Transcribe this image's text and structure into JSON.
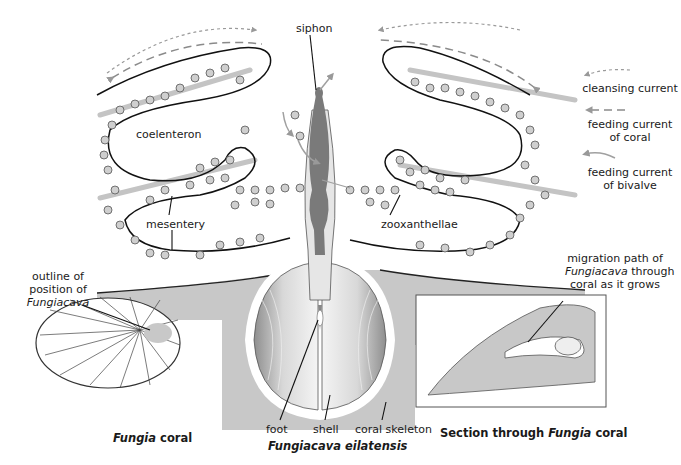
{
  "labels": {
    "siphon": "siphon",
    "coelenteron": "coelenteron",
    "mesentery": "mesentery",
    "zooxanthellae": "zooxanthellae",
    "foot": "foot",
    "shell": "shell",
    "coral_skeleton": "coral skeleton",
    "outline_line1": "outline of",
    "outline_line2": "position of",
    "outline_line3": "Fungiacava",
    "migration_line1": "migration path of",
    "migration_line2_italic": "Fungiacava",
    "migration_line2_rest": " through",
    "migration_line3": "coral as it grows"
  },
  "legend": {
    "items": [
      {
        "label": "cleansing current",
        "style": "dotted-short-dash",
        "color": "#9a9a9a"
      },
      {
        "label_line1": "feeding current",
        "label_line2": "of coral",
        "style": "long-dash",
        "color": "#8a8a8a"
      },
      {
        "label_line1": "feeding current",
        "label_line2": "of bivalve",
        "style": "solid",
        "color": "#a0a0a0"
      }
    ]
  },
  "captions": {
    "left_italic": "Fungia",
    "left_rest": " coral",
    "center": "Fungiacava eilatensis",
    "right_prefix": "Section through ",
    "right_italic": "Fungia",
    "right_suffix": " coral"
  },
  "colors": {
    "skeleton_gray": "#c8c8c8",
    "zooxanthellae_fill": "#cfcfcf",
    "mesentery_band": "#c4c4c4",
    "siphon_dark": "#7a7a7a",
    "outline": "#111111"
  }
}
